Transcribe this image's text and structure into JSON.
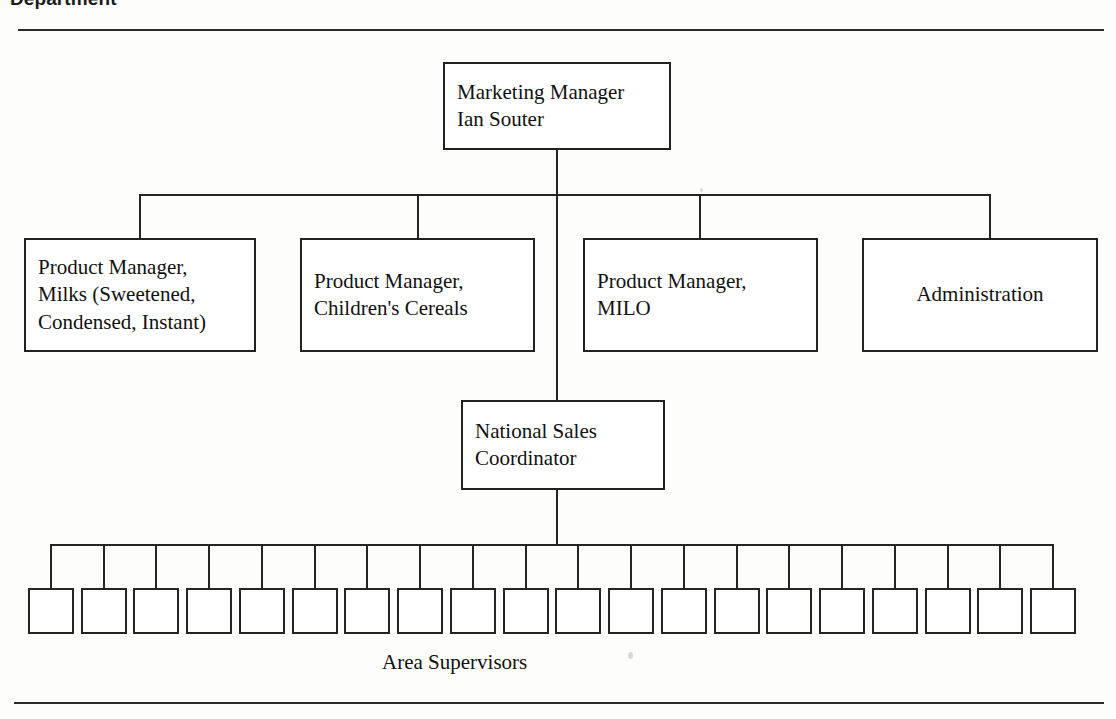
{
  "header": {
    "title": "Department"
  },
  "chart": {
    "type": "org-chart",
    "caption": "Area Supervisors",
    "root": {
      "id": "marketing-manager",
      "lines": [
        "Marketing Manager",
        "Ian Souter"
      ],
      "text": "Marketing Manager\nIan Souter",
      "align": "left"
    },
    "level2": [
      {
        "id": "product-manager-milks",
        "lines": [
          "Product Manager,",
          "Milks (Sweetened,",
          "Condensed, Instant)"
        ],
        "text": "Product Manager,\nMilks (Sweetened,\nCondensed, Instant)",
        "align": "left"
      },
      {
        "id": "product-manager-childrens-cereals",
        "lines": [
          "Product Manager,",
          "Children's Cereals"
        ],
        "text": "Product Manager,\nChildren's Cereals",
        "align": "left"
      },
      {
        "id": "product-manager-milo",
        "lines": [
          "Product Manager,",
          "MILO"
        ],
        "text": "Product Manager,\nMILO",
        "align": "left"
      },
      {
        "id": "administration",
        "lines": [
          "Administration"
        ],
        "text": "Administration",
        "align": "center"
      }
    ],
    "level3": {
      "id": "national-sales-coordinator",
      "lines": [
        "National Sales",
        "Coordinator"
      ],
      "text": "National Sales\nCoordinator",
      "align": "left"
    },
    "area_supervisors": {
      "label": "Area Supervisors",
      "count": 20,
      "boxes": [
        "",
        "",
        "",
        "",
        "",
        "",
        "",
        "",
        "",
        "",
        "",
        "",
        "",
        "",
        "",
        "",
        "",
        "",
        "",
        ""
      ]
    },
    "colors": {
      "line": "#242424",
      "box_border": "#222222",
      "box_fill": "#ffffff",
      "text": "#111111",
      "page_background": "#fdfdfc"
    }
  }
}
